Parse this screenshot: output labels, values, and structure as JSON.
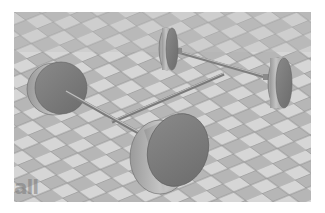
{
  "scene": {
    "description": "3D render of a four-wheeled chassis with two axles connected by a center rod, on a checkered tile floor",
    "objects": [
      {
        "name": "rear-left-wheel",
        "type": "cylinder-wheel"
      },
      {
        "name": "rear-right-wheel",
        "type": "cylinder-wheel"
      },
      {
        "name": "front-left-wheel",
        "type": "cylinder-wheel"
      },
      {
        "name": "front-right-wheel",
        "type": "cylinder-wheel"
      },
      {
        "name": "front-axle",
        "type": "rod"
      },
      {
        "name": "rear-axle",
        "type": "rod"
      },
      {
        "name": "center-chassis-rod",
        "type": "rod"
      }
    ],
    "floor": {
      "pattern": "checkered",
      "light_tile": "#d8d8d8",
      "dark_tile": "#b4b4b4",
      "grout": "#8a8a8a"
    },
    "colors": {
      "wheel_face": "#7a7a7a",
      "wheel_side": "#b0b0b0",
      "rod": "#9a9a9a",
      "background_border": "#ffffff"
    }
  },
  "watermark": {
    "text": "all"
  }
}
